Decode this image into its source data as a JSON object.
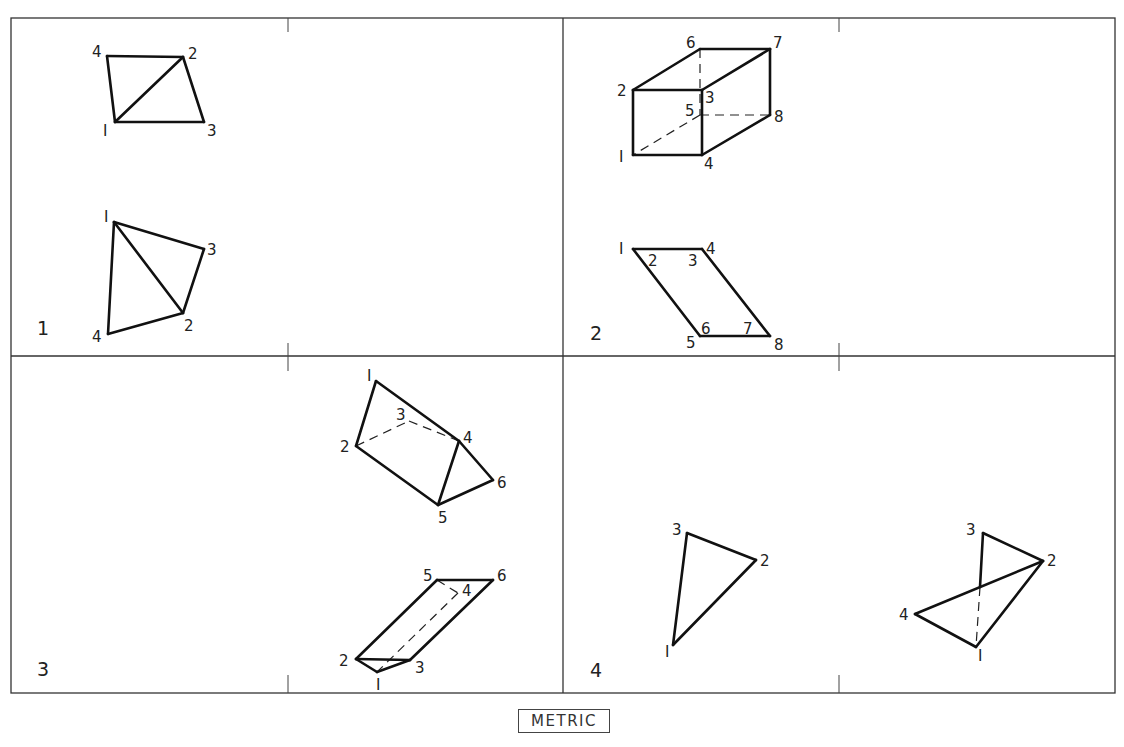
{
  "figure": {
    "panels": [
      {
        "number": "1",
        "views": [
          {
            "name": "top-view",
            "vertices": {
              "1": [
                115,
                122
              ],
              "2": [
                183,
                57
              ],
              "3": [
                204,
                122
              ],
              "4": [
                107,
                56
              ]
            },
            "labels": [
              {
                "text": "4",
                "x": 92,
                "y": 57
              },
              {
                "text": "2",
                "x": 188,
                "y": 59
              },
              {
                "text": "1",
                "x": 103,
                "y": 136
              },
              {
                "text": "3",
                "x": 207,
                "y": 136
              }
            ],
            "visible_edges": [
              [
                "4",
                "2"
              ],
              [
                "2",
                "3"
              ],
              [
                "3",
                "1"
              ],
              [
                "1",
                "4"
              ],
              [
                "1",
                "2"
              ]
            ],
            "hidden_edges": []
          },
          {
            "name": "front-view",
            "vertices": {
              "1": [
                114,
                222
              ],
              "2": [
                183,
                313
              ],
              "3": [
                204,
                249
              ],
              "4": [
                108,
                334
              ]
            },
            "labels": [
              {
                "text": "1",
                "x": 104,
                "y": 222
              },
              {
                "text": "3",
                "x": 207,
                "y": 255
              },
              {
                "text": "2",
                "x": 184,
                "y": 331
              },
              {
                "text": "4",
                "x": 92,
                "y": 342
              }
            ],
            "visible_edges": [
              [
                "1",
                "3"
              ],
              [
                "3",
                "2"
              ],
              [
                "2",
                "4"
              ],
              [
                "4",
                "1"
              ],
              [
                "1",
                "2"
              ]
            ],
            "hidden_edges": []
          }
        ],
        "number_pos": [
          37,
          335
        ]
      },
      {
        "number": "2",
        "views": [
          {
            "name": "pictorial-view",
            "vertices": {
              "1": [
                633,
                155
              ],
              "2": [
                633,
                90
              ],
              "3": [
                702,
                90
              ],
              "4": [
                702,
                155
              ],
              "5": [
                700,
                115
              ],
              "6": [
                700,
                49
              ],
              "7": [
                770,
                49
              ],
              "8": [
                770,
                115
              ]
            },
            "labels": [
              {
                "text": "6",
                "x": 686,
                "y": 48
              },
              {
                "text": "7",
                "x": 773,
                "y": 48
              },
              {
                "text": "2",
                "x": 617,
                "y": 96
              },
              {
                "text": "3",
                "x": 705,
                "y": 103
              },
              {
                "text": "5",
                "x": 685,
                "y": 116
              },
              {
                "text": "8",
                "x": 774,
                "y": 122
              },
              {
                "text": "1",
                "x": 619,
                "y": 162
              },
              {
                "text": "4",
                "x": 704,
                "y": 169
              }
            ],
            "visible_edges": [
              [
                "2",
                "6"
              ],
              [
                "6",
                "7"
              ],
              [
                "7",
                "8"
              ],
              [
                "8",
                "4"
              ],
              [
                "4",
                "1"
              ],
              [
                "1",
                "2"
              ],
              [
                "2",
                "3"
              ],
              [
                "3",
                "4"
              ],
              [
                "3",
                "7"
              ]
            ],
            "hidden_edges": [
              [
                "6",
                "5"
              ],
              [
                "5",
                "8"
              ],
              [
                "5",
                "1"
              ]
            ]
          },
          {
            "name": "top-view",
            "vertices": {
              "1": [
                633,
                249
              ],
              "4": [
                702,
                249
              ],
              "5": [
                700,
                336
              ],
              "8": [
                770,
                336
              ]
            },
            "labels": [
              {
                "text": "1",
                "x": 619,
                "y": 254
              },
              {
                "text": "4",
                "x": 706,
                "y": 254
              },
              {
                "text": "2",
                "x": 648,
                "y": 266
              },
              {
                "text": "3",
                "x": 688,
                "y": 266
              },
              {
                "text": "6",
                "x": 701,
                "y": 334
              },
              {
                "text": "7",
                "x": 743,
                "y": 334
              },
              {
                "text": "5",
                "x": 686,
                "y": 348
              },
              {
                "text": "8",
                "x": 774,
                "y": 350
              }
            ],
            "visible_edges": [
              [
                "1",
                "4"
              ],
              [
                "4",
                "8"
              ],
              [
                "8",
                "5"
              ],
              [
                "5",
                "1"
              ]
            ],
            "hidden_edges": []
          }
        ],
        "number_pos": [
          590,
          340
        ]
      },
      {
        "number": "3",
        "views": [
          {
            "name": "pictorial-view",
            "vertices": {
              "1": [
                376,
                381
              ],
              "2": [
                356,
                446
              ],
              "3": [
                409,
                421
              ],
              "4": [
                459,
                441
              ],
              "5": [
                438,
                505
              ],
              "6": [
                493,
                480
              ]
            },
            "labels": [
              {
                "text": "1",
                "x": 367,
                "y": 381
              },
              {
                "text": "3",
                "x": 396,
                "y": 420
              },
              {
                "text": "4",
                "x": 463,
                "y": 443
              },
              {
                "text": "2",
                "x": 340,
                "y": 452
              },
              {
                "text": "6",
                "x": 497,
                "y": 488
              },
              {
                "text": "5",
                "x": 438,
                "y": 523
              }
            ],
            "visible_edges": [
              [
                "1",
                "2"
              ],
              [
                "1",
                "4"
              ],
              [
                "4",
                "5"
              ],
              [
                "2",
                "5"
              ],
              [
                "5",
                "6"
              ],
              [
                "6",
                "4"
              ]
            ],
            "hidden_edges": [
              [
                "2",
                "3"
              ],
              [
                "3",
                "4"
              ]
            ]
          },
          {
            "name": "top-view",
            "vertices": {
              "1": [
                377,
                672
              ],
              "2": [
                356,
                659
              ],
              "3": [
                410,
                660
              ],
              "4": [
                458,
                593
              ],
              "5": [
                437,
                580
              ],
              "6": [
                493,
                580
              ]
            },
            "labels": [
              {
                "text": "5",
                "x": 423,
                "y": 581
              },
              {
                "text": "6",
                "x": 497,
                "y": 581
              },
              {
                "text": "4",
                "x": 462,
                "y": 596
              },
              {
                "text": "2",
                "x": 339,
                "y": 666
              },
              {
                "text": "3",
                "x": 415,
                "y": 673
              },
              {
                "text": "1",
                "x": 376,
                "y": 690
              }
            ],
            "visible_edges": [
              [
                "2",
                "5"
              ],
              [
                "5",
                "6"
              ],
              [
                "6",
                "3"
              ],
              [
                "3",
                "2"
              ],
              [
                "2",
                "1"
              ],
              [
                "1",
                "3"
              ]
            ],
            "hidden_edges": [
              [
                "5",
                "4"
              ],
              [
                "4",
                "1"
              ]
            ]
          }
        ],
        "number_pos": [
          37,
          676
        ]
      },
      {
        "number": "4",
        "views": [
          {
            "name": "front-view",
            "vertices": {
              "1": [
                673,
                645
              ],
              "2": [
                756,
                560
              ],
              "3": [
                687,
                533
              ]
            },
            "labels": [
              {
                "text": "3",
                "x": 672,
                "y": 535
              },
              {
                "text": "2",
                "x": 760,
                "y": 566
              },
              {
                "text": "1",
                "x": 665,
                "y": 657
              }
            ],
            "visible_edges": [
              [
                "3",
                "2"
              ],
              [
                "2",
                "1"
              ],
              [
                "1",
                "3"
              ]
            ],
            "hidden_edges": []
          },
          {
            "name": "top-view",
            "vertices": {
              "1": [
                976,
                647
              ],
              "2": [
                1043,
                561
              ],
              "3": [
                983,
                533
              ],
              "4": [
                915,
                614
              ],
              "x": [
                980,
                587
              ]
            },
            "labels": [
              {
                "text": "3",
                "x": 966,
                "y": 535
              },
              {
                "text": "2",
                "x": 1047,
                "y": 566
              },
              {
                "text": "4",
                "x": 899,
                "y": 620
              },
              {
                "text": "1",
                "x": 978,
                "y": 661
              }
            ],
            "visible_edges": [
              [
                "3",
                "2"
              ],
              [
                "3",
                "x"
              ],
              [
                "2",
                "4"
              ],
              [
                "4",
                "1"
              ],
              [
                "1",
                "2"
              ]
            ],
            "hidden_edges": [
              [
                "x",
                "1"
              ]
            ]
          }
        ],
        "number_pos": [
          590,
          677
        ]
      }
    ],
    "frame": {
      "left": 11,
      "top": 18,
      "right": 1115,
      "bottom": 693,
      "mid_x": 563,
      "mid_y": 356
    },
    "ticks_x": [
      288,
      839
    ],
    "footer_label": "METRIC"
  }
}
